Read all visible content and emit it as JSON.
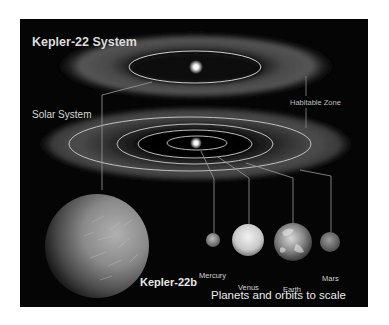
{
  "title": "Kepler-22 System",
  "solar_system_label": "Solar System",
  "habitable_zone_label": "Habitable Zone",
  "exoplanet": {
    "name": "Kepler-22b"
  },
  "planets": [
    {
      "name": "Mercury"
    },
    {
      "name": "Venus"
    },
    {
      "name": "Earth"
    },
    {
      "name": "Mars"
    }
  ],
  "caption": "Planets and orbits to scale",
  "colors": {
    "background": "#050505",
    "text": "#e2e2e2",
    "orbit_lines": "#cfcfcf",
    "habitable_zone_glow": "#5a5a5a"
  }
}
